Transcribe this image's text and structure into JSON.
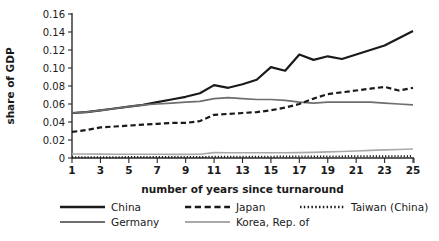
{
  "chart_data": {
    "type": "line",
    "title": "",
    "xlabel": "number of years since turnaround",
    "ylabel": "share of GDP",
    "xlim": [
      1,
      25
    ],
    "ylim": [
      0,
      0.16
    ],
    "grid": false,
    "legend_position": "bottom",
    "x": [
      1,
      2,
      3,
      4,
      5,
      6,
      7,
      8,
      9,
      10,
      11,
      12,
      13,
      14,
      15,
      16,
      17,
      18,
      19,
      20,
      21,
      22,
      23,
      24,
      25
    ],
    "xticks": [
      "1",
      "3",
      "5",
      "7",
      "9",
      "11",
      "13",
      "15",
      "17",
      "19",
      "21",
      "23",
      "25"
    ],
    "yticks": [
      "0",
      "0.02",
      "0.04",
      "0.06",
      "0.08",
      "0.10",
      "0.12",
      "0.14",
      "0.16"
    ],
    "series": [
      {
        "name": "China",
        "style": "solid",
        "color": "#1a1a1a",
        "width": 2.2,
        "values": [
          0.05,
          0.051,
          0.053,
          0.055,
          0.057,
          0.059,
          0.062,
          0.065,
          0.068,
          0.072,
          0.081,
          0.078,
          0.082,
          0.087,
          0.101,
          0.097,
          0.115,
          0.109,
          0.113,
          0.11,
          0.115,
          0.12,
          0.125,
          0.133,
          0.141
        ]
      },
      {
        "name": "Germany",
        "style": "solid",
        "color": "#6e6e6e",
        "width": 1.7,
        "values": [
          0.05,
          0.051,
          0.053,
          0.055,
          0.057,
          0.059,
          0.06,
          0.061,
          0.062,
          0.063,
          0.066,
          0.067,
          0.066,
          0.065,
          0.065,
          0.064,
          0.062,
          0.061,
          0.062,
          0.062,
          0.062,
          0.062,
          0.061,
          0.06,
          0.059
        ]
      },
      {
        "name": "Japan",
        "style": "dashed",
        "color": "#1a1a1a",
        "width": 2.2,
        "values": [
          0.029,
          0.031,
          0.034,
          0.035,
          0.036,
          0.037,
          0.038,
          0.039,
          0.039,
          0.041,
          0.048,
          0.049,
          0.05,
          0.051,
          0.053,
          0.056,
          0.06,
          0.066,
          0.071,
          0.073,
          0.075,
          0.077,
          0.079,
          0.075,
          0.078
        ]
      },
      {
        "name": "Korea, Rep. of",
        "style": "solid",
        "color": "#a9a9a9",
        "width": 1.6,
        "values": [
          0.0045,
          0.0045,
          0.0043,
          0.0042,
          0.0042,
          0.0041,
          0.0041,
          0.004,
          0.004,
          0.0042,
          0.006,
          0.0058,
          0.0058,
          0.0058,
          0.0058,
          0.0058,
          0.006,
          0.0063,
          0.0068,
          0.0072,
          0.0078,
          0.0085,
          0.009,
          0.0095,
          0.01
        ]
      },
      {
        "name": "Taiwan (China)",
        "style": "dotted",
        "color": "#1a1a1a",
        "width": 2.0,
        "values": [
          0.0008,
          0.0008,
          0.0009,
          0.0009,
          0.001,
          0.001,
          0.0011,
          0.0011,
          0.0012,
          0.0012,
          0.0013,
          0.0014,
          0.0014,
          0.0015,
          0.0015,
          0.0016,
          0.0017,
          0.0017,
          0.0018,
          0.0018,
          0.0019,
          0.0019,
          0.002,
          0.002,
          0.0021
        ]
      }
    ],
    "legend": [
      {
        "label": "China",
        "style": "solid",
        "color": "#1a1a1a",
        "width": 2.6
      },
      {
        "label": "Japan",
        "style": "dashed",
        "color": "#1a1a1a",
        "width": 2.6
      },
      {
        "label": "Taiwan (China)",
        "style": "dotted",
        "color": "#1a1a1a",
        "width": 2.4
      },
      {
        "label": "Germany",
        "style": "solid",
        "color": "#6e6e6e",
        "width": 2.0
      },
      {
        "label": "Korea, Rep. of",
        "style": "solid",
        "color": "#a9a9a9",
        "width": 1.8
      }
    ]
  }
}
